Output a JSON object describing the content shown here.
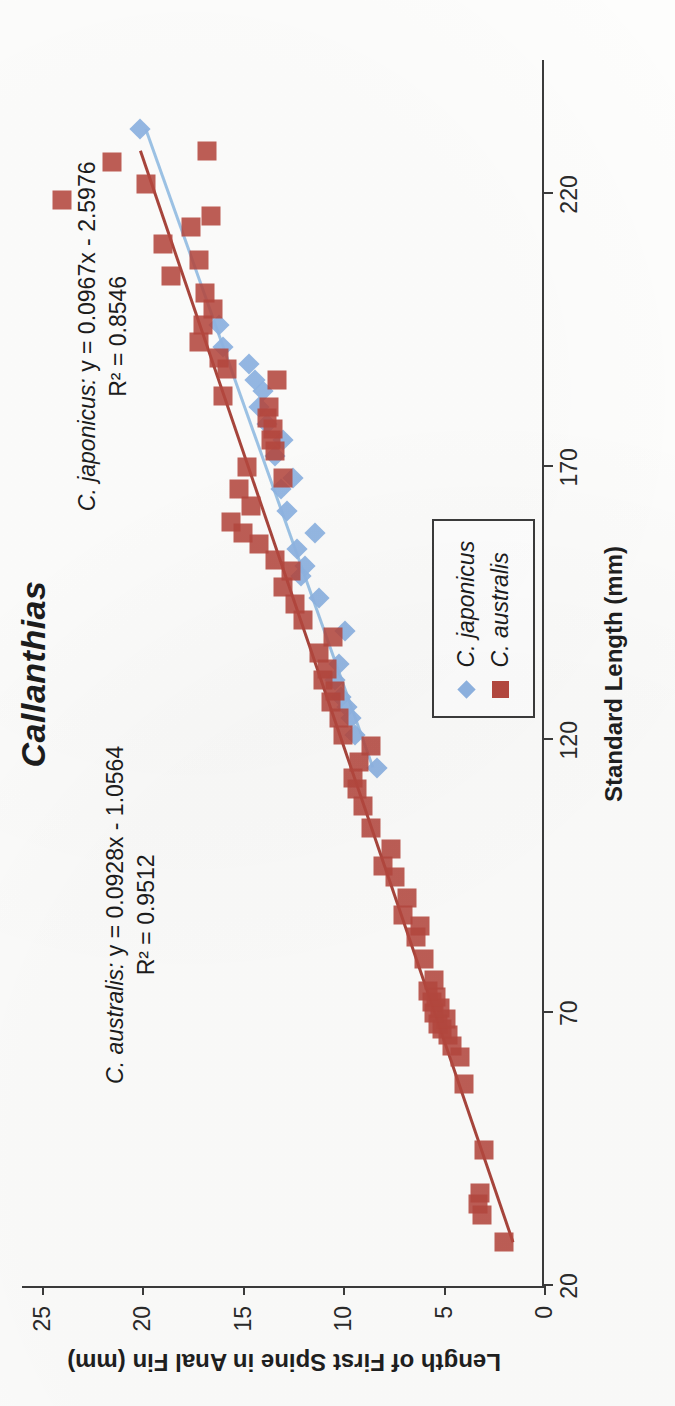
{
  "chart_data": {
    "type": "scatter",
    "title": "Callanthias",
    "xlabel": "Standard Length (mm)",
    "ylabel": "Length of First Spine in Anal Fin (mm)",
    "xlim": [
      20,
      245
    ],
    "ylim": [
      0,
      26
    ],
    "xticks": [
      20,
      70,
      120,
      170,
      220
    ],
    "yticks": [
      0,
      5,
      10,
      15,
      20,
      25
    ],
    "grid": false,
    "legend_position": "inside-lower-right",
    "series": [
      {
        "name": "C. japonicus",
        "marker": "diamond",
        "color": "#8fb4e3",
        "trendline": {
          "slope": 0.0967,
          "intercept": -2.5976,
          "r2": 0.8546,
          "color": "#9dc3e6",
          "x_from": 115,
          "x_to": 232
        },
        "points": [
          [
            115.0,
            8.3
          ],
          [
            121.0,
            9.4
          ],
          [
            124.0,
            9.6
          ],
          [
            126.0,
            9.8
          ],
          [
            128.0,
            10.1
          ],
          [
            131.0,
            10.4
          ],
          [
            134.0,
            10.2
          ],
          [
            140.0,
            9.9
          ],
          [
            146.0,
            11.2
          ],
          [
            150.0,
            12.1
          ],
          [
            152.0,
            11.9
          ],
          [
            155.0,
            12.3
          ],
          [
            158.0,
            11.4
          ],
          [
            162.0,
            12.8
          ],
          [
            166.0,
            13.1
          ],
          [
            168.0,
            12.5
          ],
          [
            172.0,
            13.4
          ],
          [
            175.0,
            13.0
          ],
          [
            178.0,
            13.8
          ],
          [
            181.0,
            14.2
          ],
          [
            184.0,
            14.0
          ],
          [
            186.0,
            14.4
          ],
          [
            189.0,
            14.7
          ],
          [
            192.0,
            16.0
          ],
          [
            196.0,
            16.2
          ],
          [
            232.0,
            20.1
          ]
        ]
      },
      {
        "name": "C. australis",
        "marker": "square",
        "color": "#b5483f",
        "trendline": {
          "slope": 0.0928,
          "intercept": -1.0564,
          "r2": 0.9512,
          "color": "#a8453c",
          "x_from": 28,
          "x_to": 228
        },
        "points": [
          [
            28.0,
            2.0
          ],
          [
            33.0,
            3.1
          ],
          [
            35.0,
            3.3
          ],
          [
            37.0,
            3.2
          ],
          [
            45.0,
            3.0
          ],
          [
            57.0,
            4.0
          ],
          [
            62.0,
            4.2
          ],
          [
            64.0,
            4.6
          ],
          [
            66.0,
            4.8
          ],
          [
            67.0,
            5.1
          ],
          [
            68.0,
            5.3
          ],
          [
            69.0,
            4.9
          ],
          [
            70.0,
            5.5
          ],
          [
            71.0,
            5.2
          ],
          [
            72.0,
            5.6
          ],
          [
            73.0,
            5.4
          ],
          [
            74.0,
            5.8
          ],
          [
            76.0,
            5.5
          ],
          [
            80.0,
            6.0
          ],
          [
            84.0,
            6.4
          ],
          [
            86.0,
            6.2
          ],
          [
            88.0,
            7.0
          ],
          [
            91.0,
            6.8
          ],
          [
            95.0,
            7.4
          ],
          [
            97.0,
            8.0
          ],
          [
            100.0,
            7.6
          ],
          [
            104.0,
            8.6
          ],
          [
            108.0,
            9.0
          ],
          [
            111.0,
            9.3
          ],
          [
            113.0,
            9.5
          ],
          [
            116.0,
            9.2
          ],
          [
            119.0,
            8.6
          ],
          [
            121.0,
            10.0
          ],
          [
            124.0,
            10.2
          ],
          [
            127.0,
            10.6
          ],
          [
            129.0,
            10.4
          ],
          [
            131.0,
            11.0
          ],
          [
            133.0,
            10.8
          ],
          [
            136.0,
            11.2
          ],
          [
            139.0,
            10.5
          ],
          [
            142.0,
            12.0
          ],
          [
            145.0,
            12.4
          ],
          [
            148.0,
            13.0
          ],
          [
            151.0,
            12.6
          ],
          [
            153.0,
            13.4
          ],
          [
            156.0,
            14.2
          ],
          [
            158.0,
            15.0
          ],
          [
            160.0,
            15.6
          ],
          [
            163.0,
            14.6
          ],
          [
            166.0,
            15.2
          ],
          [
            168.0,
            13.0
          ],
          [
            170.0,
            14.8
          ],
          [
            173.0,
            13.4
          ],
          [
            175.0,
            13.6
          ],
          [
            177.0,
            13.5
          ],
          [
            179.0,
            13.8
          ],
          [
            181.0,
            13.7
          ],
          [
            183.0,
            16.0
          ],
          [
            186.0,
            13.3
          ],
          [
            188.0,
            15.8
          ],
          [
            190.0,
            16.2
          ],
          [
            193.0,
            17.2
          ],
          [
            196.0,
            17.0
          ],
          [
            199.0,
            16.5
          ],
          [
            202.0,
            16.9
          ],
          [
            205.0,
            18.6
          ],
          [
            208.0,
            17.2
          ],
          [
            211.0,
            19.0
          ],
          [
            214.0,
            17.6
          ],
          [
            216.0,
            16.6
          ],
          [
            219.0,
            24.0
          ],
          [
            222.0,
            19.8
          ],
          [
            226.0,
            21.5
          ],
          [
            228.0,
            16.8
          ]
        ]
      }
    ],
    "annotations": [
      {
        "id": "australis-eq",
        "species": "C. australis:",
        "equation": " y = 0.0928x - 1.0564",
        "r2": "R² = 0.9512"
      },
      {
        "id": "japonicus-eq",
        "species": "C. japonicus:",
        "equation": " y = 0.0967x - 2.5976",
        "r2": "R² = 0.8546"
      }
    ]
  },
  "legend": {
    "items": [
      {
        "label": "C. japonicus",
        "marker": "diamond",
        "color": "#8fb4e3"
      },
      {
        "label": "C. australis",
        "marker": "square",
        "color": "#b5483f"
      }
    ]
  }
}
